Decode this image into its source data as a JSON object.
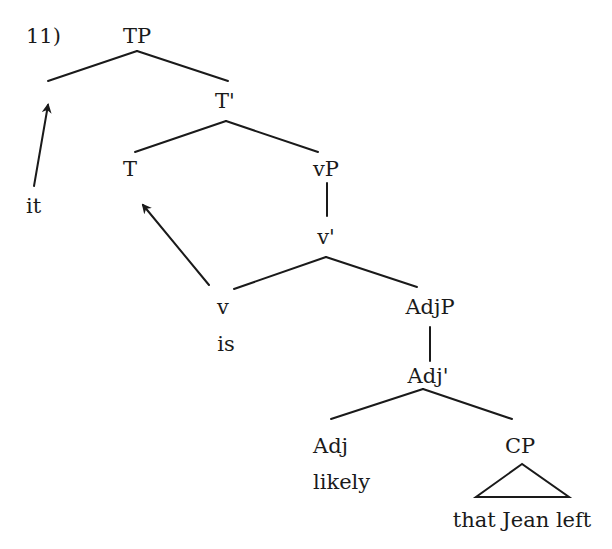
{
  "example_number": "11)",
  "nodes": {
    "TP": "TP",
    "T_bar": "T'",
    "spec": "it",
    "T": "T",
    "vP": "vP",
    "v_bar": "v'",
    "v": "v",
    "v_word": "is",
    "AdjP": "AdjP",
    "Adj_bar": "Adj'",
    "Adj": "Adj",
    "Adj_word": "likely",
    "CP": "CP",
    "CP_yield": "that Jean left"
  },
  "movements": [
    {
      "from": "it",
      "to": "Spec,TP"
    },
    {
      "from": "v",
      "to": "T"
    }
  ],
  "colors": {
    "ink": "#1a1a1a",
    "background": "#ffffff"
  }
}
